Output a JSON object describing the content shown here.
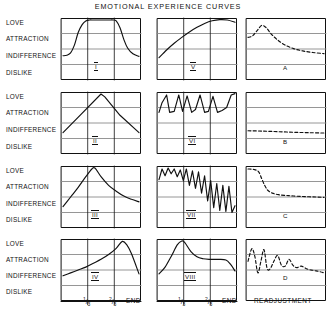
{
  "figure": {
    "title": "EMOTIONAL  EXPERIENCE  CURVES",
    "y_axis_labels": [
      "LOVE",
      "ATTRACTION",
      "INDIFFERENCE",
      "DISLIKE"
    ],
    "x_axis_ticks": [
      "1/3",
      "2/3",
      "END"
    ],
    "x_tick_numerators": [
      "1",
      "2"
    ],
    "x_tick_denominators": [
      "3",
      "3"
    ],
    "x_end_label": "END",
    "readjustment_label": "READJUSTMENT",
    "line_color": "#111111",
    "grid_color": "#8a8a8a",
    "frame_color": "#111111",
    "background": "#ffffff"
  },
  "panels": [
    {
      "id": "I",
      "label": "I",
      "row": 1,
      "col": 1,
      "style": "solid",
      "description": "rises from indifference to love, plateau, falls back toward indifference"
    },
    {
      "id": "V",
      "label": "V",
      "row": 1,
      "col": 2,
      "style": "solid",
      "description": "steady rise from indifference up to love, levels and dips slightly at end"
    },
    {
      "id": "A",
      "label": "A",
      "row": 1,
      "col": 3,
      "style": "dashed",
      "description": "sharp early peak above attraction then long decay"
    },
    {
      "id": "II",
      "label": "II",
      "row": 2,
      "col": 1,
      "style": "solid",
      "description": "linear rise to love peak at middle then linear fall to indifference"
    },
    {
      "id": "VI",
      "label": "VI",
      "row": 2,
      "col": 2,
      "style": "solid",
      "description": "repeated oscillation between attraction and love, constant amplitude"
    },
    {
      "id": "B",
      "label": "B",
      "row": 2,
      "col": 3,
      "style": "dashed",
      "description": "nearly flat slightly declining dashed line just above indifference"
    },
    {
      "id": "III",
      "label": "III",
      "row": 3,
      "col": 1,
      "style": "solid",
      "description": "rise to love peak at one third then slow decay to indifference"
    },
    {
      "id": "VII",
      "label": "VII",
      "row": 3,
      "col": 2,
      "style": "solid",
      "description": "sawtooth oscillation with growing amplitude and falling baseline"
    },
    {
      "id": "C",
      "label": "C",
      "row": 3,
      "col": 3,
      "style": "dashed",
      "description": "high plateau then step down off the bottom of the chart"
    },
    {
      "id": "IV",
      "label": "IV",
      "row": 4,
      "col": 1,
      "style": "solid",
      "description": "slow rise from indifference to a late love peak then sharp drop"
    },
    {
      "id": "VIII",
      "label": "VIII",
      "row": 4,
      "col": 2,
      "style": "solid",
      "description": "early love peak, decay to attraction plateau, dip at end"
    },
    {
      "id": "D",
      "label": "D",
      "row": 4,
      "col": 3,
      "style": "dashed",
      "description": "damped oscillation decaying to a low steady level"
    }
  ],
  "chart_data": {
    "type": "line",
    "title": "EMOTIONAL  EXPERIENCE  CURVES",
    "xlabel": "",
    "ylabel": "",
    "ylim": [
      0,
      3
    ],
    "ytick_labels": [
      "DISLIKE",
      "INDIFFERENCE",
      "ATTRACTION",
      "LOVE"
    ],
    "ytick_values": [
      0,
      1,
      2,
      3
    ],
    "xlim": [
      0,
      1
    ],
    "xtick_labels": [
      "1/3",
      "2/3",
      "END"
    ],
    "xtick_values": [
      0.3333,
      0.6667,
      1.0
    ],
    "grid": true,
    "legend": "none",
    "series": [
      {
        "name": "I",
        "style": "solid",
        "x": [
          0.0,
          0.05,
          0.1,
          0.15,
          0.2,
          0.25,
          0.3,
          0.35,
          0.4,
          0.5,
          0.6,
          0.66,
          0.7,
          0.75,
          0.8,
          0.85,
          0.92,
          1.0
        ],
        "y": [
          1.15,
          1.18,
          1.3,
          1.7,
          2.35,
          2.75,
          2.95,
          3.0,
          3.0,
          3.0,
          3.0,
          3.0,
          2.95,
          2.6,
          2.0,
          1.55,
          1.25,
          1.12
        ]
      },
      {
        "name": "V",
        "style": "solid",
        "x": [
          0.0,
          0.1,
          0.2,
          0.3,
          0.4,
          0.5,
          0.6,
          0.7,
          0.8,
          0.9,
          1.0
        ],
        "y": [
          1.05,
          1.45,
          1.8,
          2.1,
          2.38,
          2.62,
          2.82,
          2.96,
          3.02,
          3.0,
          2.88
        ]
      },
      {
        "name": "A",
        "style": "dashed",
        "x": [
          0.0,
          0.06,
          0.12,
          0.18,
          0.24,
          0.3,
          0.38,
          0.48,
          0.6,
          0.72,
          0.85,
          1.0
        ],
        "y": [
          2.1,
          2.18,
          2.45,
          2.72,
          2.6,
          2.3,
          2.0,
          1.72,
          1.52,
          1.4,
          1.32,
          1.26
        ]
      },
      {
        "name": "II",
        "style": "solid",
        "x": [
          0.0,
          0.25,
          0.5,
          0.55,
          0.75,
          1.0
        ],
        "y": [
          1.0,
          2.0,
          3.0,
          2.85,
          1.9,
          1.0
        ]
      },
      {
        "name": "VI",
        "style": "solid",
        "x": [
          0.0,
          0.04,
          0.1,
          0.14,
          0.2,
          0.26,
          0.31,
          0.37,
          0.43,
          0.48,
          0.54,
          0.6,
          0.65,
          0.71,
          0.77,
          0.83,
          0.89,
          0.95,
          1.0
        ],
        "y": [
          2.05,
          2.55,
          2.95,
          2.05,
          2.1,
          2.95,
          2.1,
          2.9,
          2.05,
          2.2,
          2.95,
          2.05,
          2.1,
          2.88,
          2.05,
          2.15,
          2.3,
          2.95,
          3.02
        ]
      },
      {
        "name": "B",
        "style": "dashed",
        "x": [
          0.0,
          0.2,
          0.4,
          0.6,
          0.8,
          1.0
        ],
        "y": [
          1.1,
          1.08,
          1.05,
          1.02,
          1.0,
          0.98
        ]
      },
      {
        "name": "III",
        "style": "solid",
        "x": [
          0.0,
          0.1,
          0.2,
          0.3,
          0.38,
          0.42,
          0.5,
          0.6,
          0.7,
          0.8,
          0.9,
          1.0
        ],
        "y": [
          1.0,
          1.5,
          2.0,
          2.55,
          2.95,
          3.0,
          2.55,
          2.1,
          1.8,
          1.55,
          1.38,
          1.25
        ]
      },
      {
        "name": "VII",
        "style": "solid",
        "x": [
          0.0,
          0.04,
          0.08,
          0.12,
          0.16,
          0.2,
          0.24,
          0.28,
          0.32,
          0.36,
          0.4,
          0.44,
          0.48,
          0.52,
          0.56,
          0.6,
          0.64,
          0.68,
          0.72,
          0.76,
          0.8,
          0.84,
          0.88,
          0.92,
          0.96,
          1.0
        ],
        "y": [
          2.4,
          2.95,
          2.6,
          3.0,
          2.7,
          2.95,
          2.55,
          2.9,
          2.35,
          2.95,
          2.1,
          2.85,
          1.95,
          2.8,
          1.7,
          2.6,
          1.3,
          2.35,
          0.95,
          2.2,
          0.8,
          2.1,
          0.75,
          2.05,
          0.7,
          1.05
        ]
      },
      {
        "name": "C",
        "style": "dashed",
        "x": [
          0.0,
          0.08,
          0.14,
          0.18,
          0.22,
          0.26,
          0.32,
          0.4,
          0.5,
          0.6,
          0.75,
          0.9,
          1.0
        ],
        "y": [
          2.95,
          2.92,
          2.8,
          2.45,
          2.1,
          1.85,
          1.7,
          1.62,
          1.58,
          1.55,
          1.52,
          1.5,
          1.48
        ]
      },
      {
        "name": "IV",
        "style": "solid",
        "x": [
          0.0,
          0.1,
          0.2,
          0.3,
          0.4,
          0.5,
          0.6,
          0.7,
          0.78,
          0.84,
          0.9,
          1.0
        ],
        "y": [
          1.2,
          1.35,
          1.5,
          1.65,
          1.85,
          2.05,
          2.3,
          2.62,
          2.98,
          2.8,
          2.35,
          1.3
        ]
      },
      {
        "name": "VIII",
        "style": "solid",
        "x": [
          0.0,
          0.08,
          0.16,
          0.24,
          0.3,
          0.34,
          0.42,
          0.5,
          0.58,
          0.66,
          0.78,
          0.88,
          0.94,
          1.0
        ],
        "y": [
          1.3,
          1.65,
          2.2,
          2.8,
          3.0,
          2.92,
          2.45,
          2.18,
          2.08,
          2.05,
          2.05,
          2.02,
          1.8,
          1.45
        ]
      },
      {
        "name": "D",
        "style": "dashed",
        "x": [
          0.0,
          0.05,
          0.09,
          0.13,
          0.17,
          0.21,
          0.25,
          0.29,
          0.34,
          0.39,
          0.44,
          0.49,
          0.54,
          0.59,
          0.64,
          0.7,
          0.78,
          0.86,
          0.94,
          1.0
        ],
        "y": [
          1.95,
          2.6,
          2.2,
          1.35,
          1.95,
          2.55,
          1.6,
          1.55,
          1.95,
          2.25,
          1.75,
          1.7,
          2.05,
          1.75,
          1.62,
          1.7,
          1.55,
          1.48,
          1.42,
          1.35
        ]
      }
    ]
  }
}
